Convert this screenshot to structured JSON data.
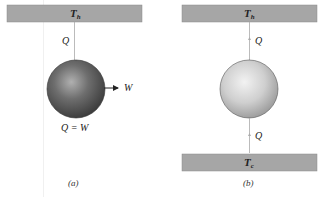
{
  "diagram": {
    "panel_a": {
      "hot_reservoir": {
        "label": "T",
        "sub": "h"
      },
      "heat_in": "Q",
      "work_out": "W",
      "equation": "Q = W",
      "caption": "(a)",
      "engine_color": "#5a5a5a"
    },
    "panel_b": {
      "hot_reservoir": {
        "label": "T",
        "sub": "h"
      },
      "heat_top": "Q",
      "heat_bottom": "Q",
      "cold_reservoir": {
        "label": "T",
        "sub": "c"
      },
      "caption": "(b)",
      "engine_color": "#bdbdbd"
    },
    "colors": {
      "reservoir_fill": "#a6a6a6",
      "line": "#999999",
      "arrow": "#222222"
    }
  }
}
